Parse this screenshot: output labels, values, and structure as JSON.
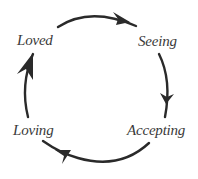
{
  "diagram": {
    "type": "cycle",
    "direction": "clockwise",
    "colors": {
      "background": "#ffffff",
      "stroke": "#2a2a2a",
      "text": "#3a3a3a"
    },
    "nodes": [
      {
        "id": "loved",
        "label": "Loved",
        "position": "top-left"
      },
      {
        "id": "seeing",
        "label": "Seeing",
        "position": "top-right"
      },
      {
        "id": "accepting",
        "label": "Accepting",
        "position": "bottom-right"
      },
      {
        "id": "loving",
        "label": "Loving",
        "position": "bottom-left"
      }
    ],
    "edges": [
      {
        "from": "loved",
        "to": "seeing",
        "arc": "top",
        "arrowhead": "right"
      },
      {
        "from": "seeing",
        "to": "accepting",
        "arc": "right",
        "arrowhead": "down"
      },
      {
        "from": "accepting",
        "to": "loving",
        "arc": "bottom",
        "arrowhead": "left"
      },
      {
        "from": "loving",
        "to": "loved",
        "arc": "left",
        "arrowhead": "up"
      }
    ]
  }
}
